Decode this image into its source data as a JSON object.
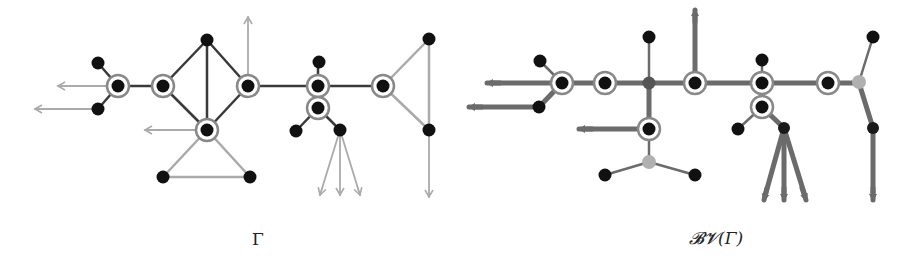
{
  "captions": {
    "left": "Γ",
    "right": "𝓑𝓥(Γ)"
  },
  "colors": {
    "vertex": "#111111",
    "dark_edge": "#3a3a3a",
    "light_edge": "#aaaaaa",
    "thick_edge": "#6b6b6b",
    "ring": "#888888",
    "light_vertex": "#b0b0b0"
  },
  "left_graph": {
    "label": "Γ",
    "ringed_vertices": [
      [
        118,
        86
      ],
      [
        163,
        86
      ],
      [
        248,
        86
      ],
      [
        318,
        86
      ],
      [
        318,
        108
      ],
      [
        383,
        86
      ],
      [
        207,
        130
      ]
    ],
    "plain_vertices": [
      [
        98,
        63
      ],
      [
        98,
        109
      ],
      [
        207,
        40
      ],
      [
        163,
        177
      ],
      [
        250,
        177
      ],
      [
        296,
        131
      ],
      [
        340,
        130
      ],
      [
        319,
        62
      ],
      [
        429,
        39
      ],
      [
        429,
        130
      ]
    ],
    "dark_edges": [
      [
        98,
        63,
        118,
        86
      ],
      [
        98,
        109,
        118,
        86
      ],
      [
        118,
        86,
        163,
        86
      ],
      [
        163,
        86,
        207,
        40
      ],
      [
        207,
        40,
        248,
        86
      ],
      [
        163,
        86,
        207,
        130
      ],
      [
        207,
        130,
        248,
        86
      ],
      [
        207,
        40,
        207,
        130
      ],
      [
        248,
        86,
        318,
        86
      ],
      [
        318,
        86,
        383,
        86
      ],
      [
        318,
        62,
        318,
        86
      ],
      [
        318,
        86,
        318,
        108
      ],
      [
        318,
        108,
        296,
        131
      ],
      [
        318,
        108,
        340,
        130
      ]
    ],
    "light_edges": [
      [
        207,
        130,
        163,
        177
      ],
      [
        207,
        130,
        250,
        177
      ],
      [
        163,
        177,
        250,
        177
      ],
      [
        383,
        86,
        429,
        39
      ],
      [
        383,
        86,
        429,
        130
      ],
      [
        429,
        39,
        429,
        130
      ]
    ],
    "arrows": [
      [
        118,
        86,
        58,
        86
      ],
      [
        98,
        109,
        35,
        109
      ],
      [
        207,
        130,
        145,
        130
      ],
      [
        248,
        86,
        248,
        17
      ],
      [
        340,
        130,
        320,
        195
      ],
      [
        340,
        130,
        340,
        195
      ],
      [
        340,
        130,
        360,
        195
      ],
      [
        429,
        130,
        429,
        197
      ]
    ]
  },
  "right_graph": {
    "label": "𝓑𝓥(Γ)",
    "ringed_vertices": [
      [
        562,
        83
      ],
      [
        605,
        83
      ],
      [
        695,
        83
      ],
      [
        762,
        83
      ],
      [
        762,
        107
      ],
      [
        828,
        83
      ],
      [
        649,
        129
      ]
    ],
    "plain_vertices": [
      [
        540,
        61
      ],
      [
        539,
        107
      ],
      [
        649,
        37
      ],
      [
        762,
        60
      ],
      [
        738,
        129
      ],
      [
        605,
        175
      ],
      [
        695,
        175
      ],
      [
        873,
        37
      ]
    ],
    "small_dark_vertices": [
      [
        784,
        128
      ],
      [
        873,
        128
      ]
    ],
    "hub_vertices": [
      [
        649,
        83
      ]
    ],
    "light_vertices": [
      [
        649,
        162
      ],
      [
        859,
        82
      ]
    ],
    "thin_edges": [
      [
        540,
        61,
        562,
        83
      ],
      [
        649,
        37,
        649,
        83
      ],
      [
        762,
        60,
        762,
        83
      ],
      [
        762,
        107,
        738,
        129
      ],
      [
        649,
        162,
        605,
        175
      ],
      [
        649,
        162,
        695,
        175
      ],
      [
        873,
        37,
        859,
        82
      ],
      [
        649,
        129,
        649,
        162
      ]
    ],
    "thick_edges": [
      [
        493,
        83,
        859,
        83
      ],
      [
        475,
        107,
        539,
        107
      ],
      [
        539,
        107,
        562,
        83
      ],
      [
        649,
        83,
        649,
        129
      ],
      [
        585,
        129,
        649,
        129
      ],
      [
        695,
        83,
        695,
        15
      ],
      [
        762,
        83,
        762,
        107
      ],
      [
        762,
        107,
        784,
        128
      ],
      [
        784,
        128,
        765,
        196
      ],
      [
        784,
        128,
        784,
        196
      ],
      [
        784,
        128,
        805,
        196
      ],
      [
        859,
        83,
        873,
        128
      ],
      [
        873,
        128,
        873,
        196
      ]
    ]
  }
}
